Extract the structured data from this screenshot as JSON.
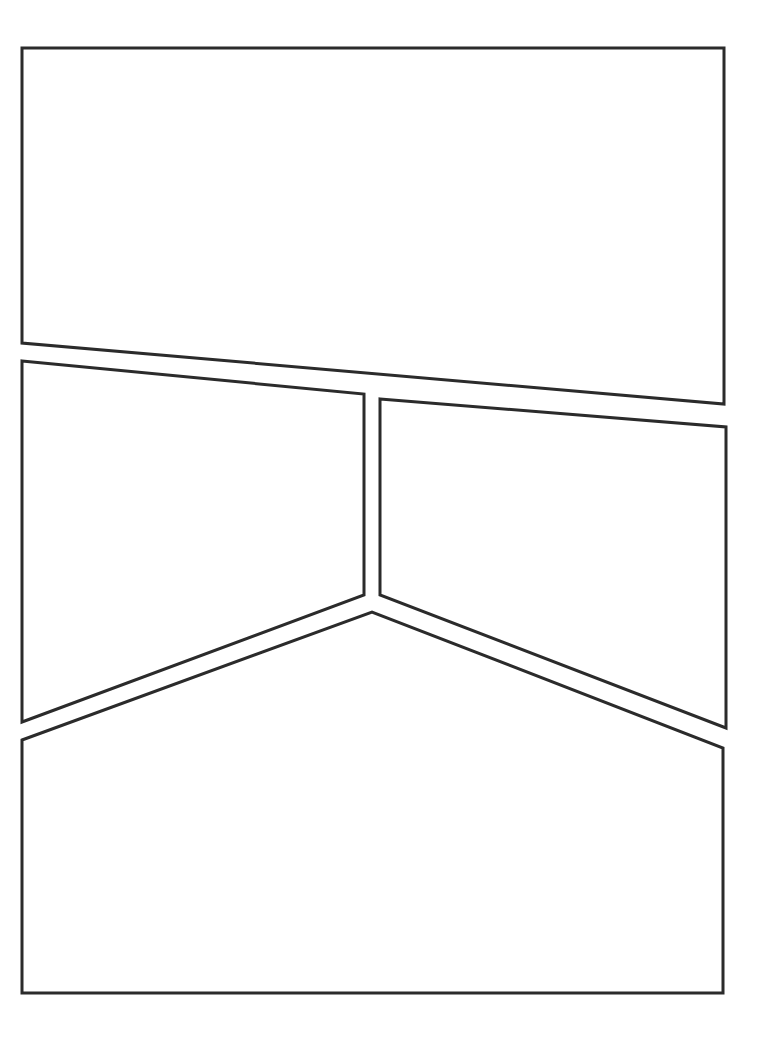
{
  "page": {
    "width": 769,
    "height": 1038,
    "background_color": "#ffffff",
    "paper_color": "#ffffff",
    "gutter_color": "#ffffff"
  },
  "style": {
    "border_color": "#2b2b2b",
    "border_width": 3,
    "line_join": "miter",
    "fill_color": "#ffffff"
  },
  "layout": {
    "panel_count": 4,
    "description": "Four empty comic panels with angled gutters: one wide top panel, two mid panels split by a vertical gutter forming a downward V, and one wide bottom panel."
  },
  "panels": [
    {
      "id": "panel-1",
      "name": "top-panel",
      "index": 1,
      "label": "Panel 1",
      "points": "22,48 724,48 724,404 22,343",
      "content": ""
    },
    {
      "id": "panel-2",
      "name": "middle-left-panel",
      "index": 2,
      "label": "Panel 2",
      "points": "22,361 364,394 364,595 22,722",
      "content": ""
    },
    {
      "id": "panel-3",
      "name": "middle-right-panel",
      "index": 3,
      "label": "Panel 3",
      "points": "380,399 726,427 726,728 380,595",
      "content": ""
    },
    {
      "id": "panel-4",
      "name": "bottom-panel",
      "index": 4,
      "label": "Panel 4",
      "points": "22,740 372,612 723,748 723,993 22,993",
      "content": ""
    }
  ]
}
